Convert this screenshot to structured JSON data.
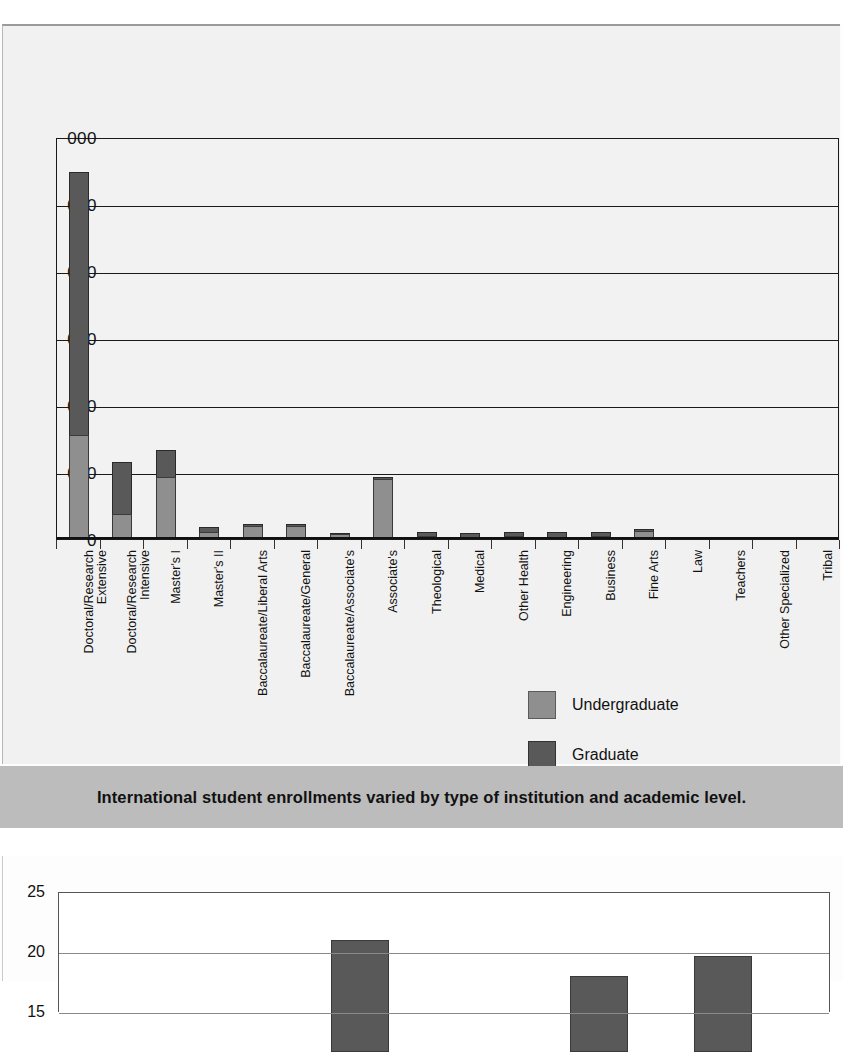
{
  "caption": {
    "text": "International student enrollments varied by type of institution and academic level."
  },
  "legend": {
    "items": [
      {
        "label": "Undergraduate",
        "color": "#8f8f8f"
      },
      {
        "label": "Graduate",
        "color": "#595959"
      }
    ]
  },
  "y_axis_visible_labels": [
    "000",
    "000",
    "000",
    "000",
    "000",
    "000",
    "0"
  ],
  "bottom_y_axis_visible_labels": [
    "25",
    "20",
    "15"
  ],
  "chart_data": [
    {
      "type": "bar",
      "subtype": "stacked-vertical",
      "title": "",
      "xlabel": "",
      "ylabel": "",
      "ylim": [
        0,
        120000
      ],
      "yticks": [
        0,
        20000,
        40000,
        60000,
        80000,
        100000,
        120000
      ],
      "ytick_labels_rendered": [
        "0",
        "000",
        "000",
        "000",
        "000",
        "000",
        "000"
      ],
      "ytick_labels_full": [
        "0",
        "20,000",
        "40,000",
        "60,000",
        "80,000",
        "100,000",
        "120,000"
      ],
      "grid": true,
      "legend_position": "inside-bottom-right",
      "note": "Left edge of figure is cropped; y tick labels show only trailing '000'.",
      "categories": [
        "Doctoral/Research Extensive",
        "Doctoral/Research Intensive",
        "Master's I",
        "Master's II",
        "Baccalaureate/Liberal Arts",
        "Baccalaureate/General",
        "Baccalaureate/Associate's",
        "Associate's",
        "Theological",
        "Medical",
        "Other Health",
        "Engineering",
        "Business",
        "Fine Arts",
        "Law",
        "Teachers",
        "Other Specialized",
        "Tribal"
      ],
      "category_lines": [
        [
          "Doctoral/Research",
          "Extensive"
        ],
        [
          "Doctoral/Research",
          "Intensive"
        ],
        [
          "Master's I",
          ""
        ],
        [
          "Master's II",
          ""
        ],
        [
          "Baccalaureate/Liberal Arts",
          ""
        ],
        [
          "Baccalaureate/General",
          ""
        ],
        [
          "Baccalaureate/Associate's",
          ""
        ],
        [
          "Associate's",
          ""
        ],
        [
          "Theological",
          ""
        ],
        [
          "Medical",
          ""
        ],
        [
          "Other Health",
          ""
        ],
        [
          "Engineering",
          ""
        ],
        [
          "Business",
          ""
        ],
        [
          "Fine Arts",
          ""
        ],
        [
          "Law",
          ""
        ],
        [
          "Teachers",
          ""
        ],
        [
          "Other Specialized",
          ""
        ],
        [
          "Tribal",
          ""
        ]
      ],
      "series": [
        {
          "name": "Undergraduate",
          "color": "#8f8f8f",
          "values": [
            31000,
            7500,
            18500,
            2000,
            4000,
            4000,
            1500,
            18000,
            800,
            500,
            900,
            700,
            900,
            2500,
            200,
            150,
            150,
            100
          ]
        },
        {
          "name": "Graduate",
          "color": "#595959",
          "values": [
            78500,
            15500,
            8000,
            1500,
            500,
            500,
            300,
            400,
            1200,
            1400,
            1100,
            1300,
            1200,
            500,
            300,
            200,
            200,
            50
          ]
        }
      ],
      "totals": [
        109500,
        23000,
        26500,
        3500,
        4500,
        4500,
        1800,
        18400,
        2000,
        1900,
        2000,
        2000,
        2100,
        3000,
        500,
        350,
        350,
        150
      ]
    },
    {
      "type": "bar",
      "title": "",
      "xlabel": "",
      "ylabel": "",
      "ylim": [
        15,
        25
      ],
      "yticks": [
        15,
        20,
        25
      ],
      "ytick_labels_rendered": [
        "25",
        "20",
        "15"
      ],
      "grid": true,
      "note": "Second figure is cut off by the bottom of the page; only the upper portion of three bars is visible.",
      "categories": [
        "",
        "",
        ""
      ],
      "values": [
        21.0,
        18.0,
        19.7
      ],
      "bar_x_fraction": [
        0.39,
        0.7,
        0.86
      ],
      "color": "#595959"
    }
  ]
}
